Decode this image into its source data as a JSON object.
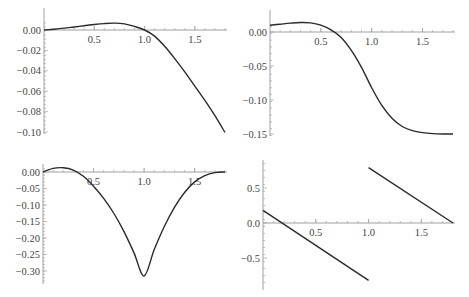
{
  "chart_data": [
    {
      "id": "top-left",
      "type": "line",
      "title": "",
      "xlabel": "",
      "ylabel": "",
      "xlim": [
        0,
        1.8
      ],
      "ylim": [
        -0.105,
        0.008
      ],
      "xticks": [
        0.5,
        1.0,
        1.5
      ],
      "xtick_labels": [
        "0.5",
        "1.0",
        "1.5"
      ],
      "yticks": [
        0.0,
        -0.02,
        -0.04,
        -0.06,
        -0.08,
        -0.1
      ],
      "ytick_labels": [
        "0.00",
        "−0.02",
        "−0.04",
        "−0.06",
        "−0.08",
        "−0.10"
      ],
      "grid": false,
      "series": [
        {
          "name": "f1",
          "x": [
            0,
            0.1,
            0.2,
            0.3,
            0.4,
            0.5,
            0.6,
            0.7,
            0.8,
            0.9,
            1.0,
            1.1,
            1.2,
            1.3,
            1.4,
            1.5,
            1.6,
            1.7,
            1.8
          ],
          "y": [
            0,
            0.0008,
            0.0018,
            0.003,
            0.0042,
            0.0054,
            0.0063,
            0.0067,
            0.006,
            0.0035,
            0.0,
            -0.006,
            -0.016,
            -0.028,
            -0.041,
            -0.055,
            -0.069,
            -0.084,
            -0.1005
          ]
        }
      ]
    },
    {
      "id": "top-right",
      "type": "line",
      "title": "",
      "xlabel": "",
      "ylabel": "",
      "xlim": [
        0,
        1.8
      ],
      "ylim": [
        -0.152,
        0.018
      ],
      "xticks": [
        0.5,
        1.0,
        1.5
      ],
      "xtick_labels": [
        "0.5",
        "1.0",
        "1.5"
      ],
      "yticks": [
        0.0,
        -0.05,
        -0.1,
        -0.15
      ],
      "ytick_labels": [
        "0.00",
        "−0.05",
        "−0.10",
        "−0.15"
      ],
      "grid": false,
      "series": [
        {
          "name": "f2",
          "x": [
            0,
            0.1,
            0.2,
            0.3,
            0.4,
            0.5,
            0.6,
            0.7,
            0.8,
            0.9,
            1.0,
            1.1,
            1.2,
            1.3,
            1.4,
            1.5,
            1.6,
            1.7,
            1.8
          ],
          "y": [
            0.01,
            0.0115,
            0.013,
            0.014,
            0.0135,
            0.01,
            0.003,
            -0.008,
            -0.027,
            -0.052,
            -0.082,
            -0.108,
            -0.127,
            -0.139,
            -0.145,
            -0.148,
            -0.1495,
            -0.15,
            -0.15
          ]
        }
      ]
    },
    {
      "id": "bottom-left",
      "type": "line",
      "title": "",
      "xlabel": "",
      "ylabel": "",
      "xlim": [
        0,
        1.8
      ],
      "ylim": [
        -0.33,
        0.018
      ],
      "xticks": [
        0.5,
        1.0,
        1.5
      ],
      "xtick_labels": [
        "0.5",
        "1.0",
        "1.5"
      ],
      "yticks": [
        0.0,
        -0.05,
        -0.1,
        -0.15,
        -0.2,
        -0.25,
        -0.3
      ],
      "ytick_labels": [
        "0.00",
        "−0.05",
        "−0.10",
        "−0.15",
        "−0.20",
        "−0.25",
        "−0.30"
      ],
      "grid": false,
      "series": [
        {
          "name": "f3",
          "x": [
            0,
            0.1,
            0.2,
            0.3,
            0.4,
            0.5,
            0.6,
            0.7,
            0.8,
            0.9,
            1.0,
            1.1,
            1.2,
            1.3,
            1.4,
            1.5,
            1.6,
            1.7,
            1.8
          ],
          "y": [
            0,
            0.011,
            0.013,
            0.006,
            -0.013,
            -0.043,
            -0.08,
            -0.125,
            -0.18,
            -0.245,
            -0.315,
            -0.235,
            -0.165,
            -0.107,
            -0.062,
            -0.03,
            -0.011,
            -0.002,
            0.0
          ]
        }
      ]
    },
    {
      "id": "bottom-right",
      "type": "line",
      "title": "",
      "xlabel": "",
      "ylabel": "",
      "xlim": [
        0,
        1.8
      ],
      "ylim": [
        -0.85,
        0.85
      ],
      "xticks": [
        0.5,
        1.0,
        1.5
      ],
      "xtick_labels": [
        "0.5",
        "1.0",
        "1.5"
      ],
      "yticks": [
        0.5,
        0.0,
        -0.5
      ],
      "ytick_labels": [
        "0.5",
        "0.0",
        "−0.5"
      ],
      "grid": false,
      "series": [
        {
          "name": "f4-segment-1",
          "x": [
            0,
            1.0
          ],
          "y": [
            0.18,
            -0.82
          ]
        },
        {
          "name": "f4-segment-2",
          "x": [
            1.0,
            1.8
          ],
          "y": [
            0.79,
            0.0
          ]
        }
      ]
    }
  ]
}
